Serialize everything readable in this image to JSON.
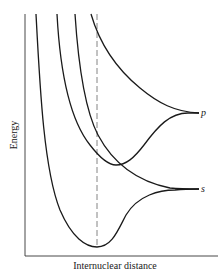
{
  "diagram": {
    "type": "potential-energy-curves",
    "ylabel": "Energy",
    "xlabel": "Internuclear distance",
    "asymptote_labels": [
      "p",
      "s"
    ],
    "line_color": "#1a1a1a",
    "dashed_line": "equilibrium internuclear distance",
    "curves": [
      {
        "name": "bonding-curve-to-s",
        "description": "deep well, minimum at dashed line, asymptote s"
      },
      {
        "name": "curve-to-p-with-shallow-well",
        "description": "shallow minimum right of dashed line, asymptote p"
      },
      {
        "name": "repulsive-curve-to-s",
        "description": "repulsive, asymptote s"
      },
      {
        "name": "repulsive-curve-to-p",
        "description": "repulsive, asymptote p"
      }
    ]
  }
}
